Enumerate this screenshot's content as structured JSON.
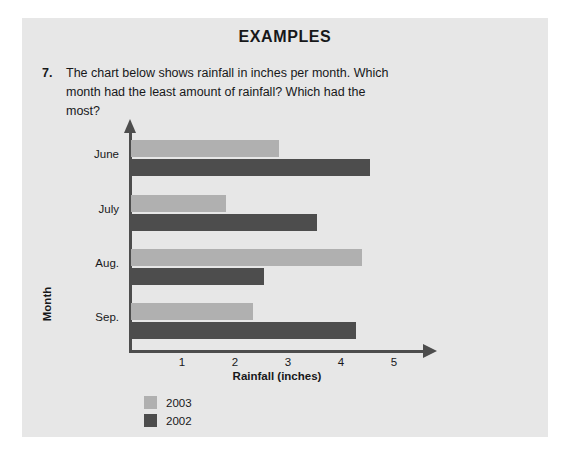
{
  "panel": {
    "heading": "EXAMPLES"
  },
  "question": {
    "number": "7.",
    "text": "The chart below shows rainfall in inches per month. Which month had the least amount of rainfall? Which had the most?"
  },
  "colors": {
    "panel_background": "#e7e7e7",
    "page_background": "#ffffff",
    "text": "#17181a",
    "axis": "#4d4d4d",
    "series_2003": "#b0b0b0",
    "series_2002": "#4d4d4d"
  },
  "chart_data": {
    "type": "bar",
    "orientation": "horizontal",
    "title": "",
    "xlabel": "Rainfall (inches)",
    "ylabel": "Month",
    "categories": [
      "June",
      "July",
      "Aug.",
      "Sep."
    ],
    "xticks": [
      "1",
      "2",
      "3",
      "4",
      "5"
    ],
    "xlim": [
      0,
      5.6
    ],
    "grid": false,
    "legend_position": "bottom-left",
    "series": [
      {
        "name": "2003",
        "color": "#b0b0b0",
        "values": [
          2.8,
          1.8,
          4.35,
          2.3
        ]
      },
      {
        "name": "2002",
        "color": "#4d4d4d",
        "values": [
          4.5,
          3.5,
          2.5,
          4.25
        ]
      }
    ]
  }
}
